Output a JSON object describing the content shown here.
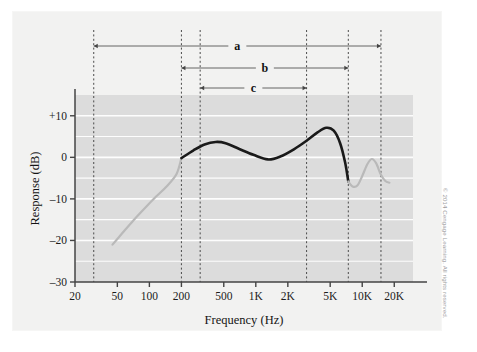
{
  "figure": {
    "copyright": "© 2014 Cengage Learning. All rights reserved.",
    "background_color": "#f2f2f1",
    "plot_band_color": "#dcdcdc",
    "gridline_color": "#fdfdfd",
    "axis_color": "#444444"
  },
  "chart_data": {
    "type": "line",
    "title": "",
    "xlabel": "Frequency (Hz)",
    "ylabel": "Response (dB)",
    "xscale": "log",
    "xlim": [
      20,
      30000
    ],
    "ylim": [
      -30,
      15
    ],
    "grid": true,
    "legend": "none",
    "xticks": [
      20,
      50,
      100,
      200,
      500,
      1000,
      2000,
      5000,
      10000,
      20000
    ],
    "xticklabels": [
      "20",
      "50",
      "100",
      "200",
      "500",
      "1K",
      "2K",
      "5K",
      "10K",
      "20K"
    ],
    "yticks": [
      -30,
      -20,
      -10,
      0,
      10
    ],
    "yticklabels": [
      "–30",
      "–20",
      "–10",
      "0",
      "+10"
    ],
    "series": [
      {
        "name": "response-outside-range",
        "color": "#b9b9b9",
        "style": "solid",
        "points": [
          [
            45,
            -21.0
          ],
          [
            55,
            -18.4
          ],
          [
            70,
            -15.3
          ],
          [
            90,
            -12.3
          ],
          [
            115,
            -9.5
          ],
          [
            145,
            -7.0
          ],
          [
            180,
            -4.0
          ],
          [
            200,
            -0.2
          ]
        ]
      },
      {
        "name": "response-main-band",
        "color": "#1a1a1a",
        "style": "solid",
        "points": [
          [
            200,
            -0.2
          ],
          [
            260,
            1.7
          ],
          [
            330,
            3.1
          ],
          [
            420,
            3.7
          ],
          [
            520,
            3.4
          ],
          [
            700,
            2.0
          ],
          [
            950,
            0.6
          ],
          [
            1300,
            -0.5
          ],
          [
            1700,
            0.2
          ],
          [
            2300,
            2.0
          ],
          [
            3000,
            4.0
          ],
          [
            3800,
            6.0
          ],
          [
            4600,
            7.1
          ],
          [
            5400,
            6.4
          ],
          [
            6200,
            3.4
          ],
          [
            6900,
            -1.2
          ],
          [
            7400,
            -5.8
          ]
        ]
      },
      {
        "name": "response-upper-tail",
        "color": "#b9b9b9",
        "style": "solid",
        "points": [
          [
            7400,
            -5.8
          ],
          [
            8100,
            -7.0
          ],
          [
            9000,
            -6.8
          ],
          [
            10000,
            -4.5
          ],
          [
            11200,
            -1.6
          ],
          [
            12300,
            -0.4
          ],
          [
            13500,
            -1.4
          ],
          [
            15000,
            -4.2
          ],
          [
            16500,
            -5.7
          ],
          [
            18000,
            -6.1
          ]
        ]
      }
    ],
    "annotations": [
      {
        "label": "a",
        "name": "bracket-a",
        "x_start": 30,
        "x_end": 15000,
        "description": "widest frequency span bracket"
      },
      {
        "label": "b",
        "name": "bracket-b",
        "x_start": 200,
        "x_end": 7400,
        "description": "middle frequency span bracket"
      },
      {
        "label": "c",
        "name": "bracket-c",
        "x_start": 300,
        "x_end": 3000,
        "description": "narrowest frequency span bracket"
      }
    ],
    "vertical_markers": [
      30,
      200,
      300,
      3000,
      7400,
      15000
    ]
  }
}
